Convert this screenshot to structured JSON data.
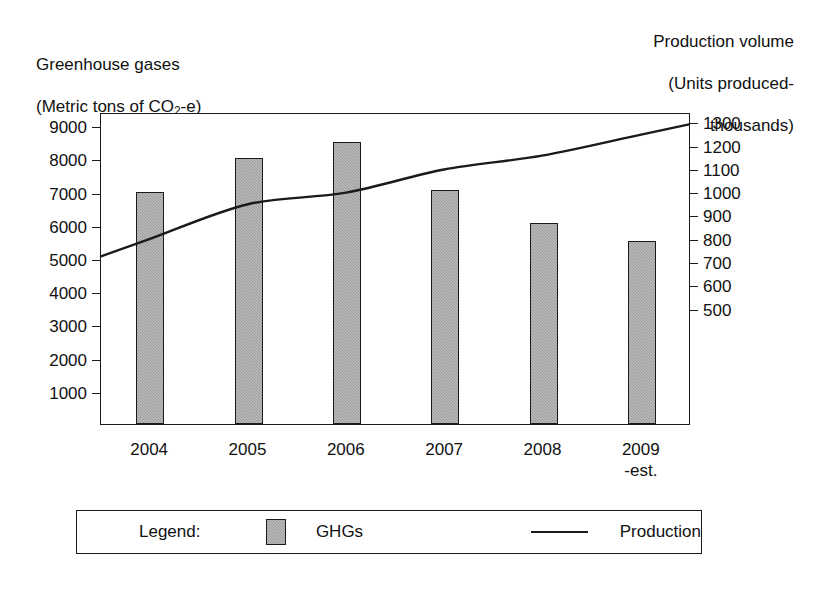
{
  "left_axis": {
    "title_line1": "Greenhouse gases",
    "title_line2_prefix": "(Metric tons of CO",
    "title_line2_sub": "2",
    "title_line2_suffix": "-e)",
    "ticks": [
      "9000",
      "8000",
      "7000",
      "6000",
      "5000",
      "4000",
      "3000",
      "2000",
      "1000"
    ]
  },
  "right_axis": {
    "title_line1": "Production volume",
    "title_line2": "(Units produced-",
    "title_line3": "thousands)",
    "ticks": [
      "1300",
      "1200",
      "1100",
      "1000",
      "900",
      "800",
      "700",
      "600",
      "500"
    ]
  },
  "x_labels": [
    "2004",
    "2005",
    "2006",
    "2007",
    "2008",
    "2009\n-est."
  ],
  "legend": {
    "label": "Legend:",
    "bar_series": "GHGs",
    "line_series": "Production"
  },
  "colors": {
    "bar_fill": "#9a9a9a",
    "outline": "#1a1a1a",
    "line": "#1a1a1a",
    "background": "#ffffff"
  },
  "chart_data": {
    "type": "bar",
    "title": "",
    "categories": [
      "2004",
      "2005",
      "2006",
      "2007",
      "2008",
      "2009 -est."
    ],
    "series": [
      {
        "name": "GHGs",
        "type": "bar",
        "axis": "left",
        "values": [
          7000,
          8000,
          8500,
          7050,
          6050,
          5500
        ]
      },
      {
        "name": "Production",
        "type": "line",
        "axis": "right",
        "values": [
          800,
          950,
          1000,
          1100,
          1160,
          1250
        ]
      }
    ],
    "xlabel": "",
    "ylabel": "Greenhouse gases (Metric tons of CO2-e)",
    "y2label": "Production volume (Units produced-thousands)",
    "ylim": [
      0,
      9400
    ],
    "y2lim": [
      0,
      1340
    ],
    "yticks": [
      1000,
      2000,
      3000,
      4000,
      5000,
      6000,
      7000,
      8000,
      9000
    ],
    "y2ticks": [
      500,
      600,
      700,
      800,
      900,
      1000,
      1100,
      1200,
      1300
    ],
    "grid": false,
    "legend_position": "bottom"
  }
}
